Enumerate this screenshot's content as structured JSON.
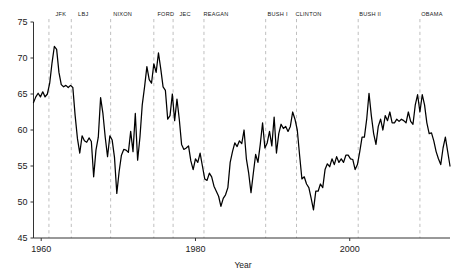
{
  "chart_data": {
    "type": "line",
    "title": "",
    "xlabel": "Year",
    "ylabel": "",
    "xlim": [
      1959,
      2013
    ],
    "ylim": [
      45,
      75
    ],
    "grid": false,
    "legend": "none",
    "x_ticks": [
      1960,
      1980,
      2000
    ],
    "x_tick_labels": [
      "1960",
      "1980",
      "2000"
    ],
    "y_ticks": [
      45,
      50,
      55,
      60,
      65,
      70,
      75
    ],
    "y_tick_labels": [
      "45",
      "50",
      "55",
      "60",
      "65",
      "70",
      "75"
    ],
    "annotations": [
      {
        "label": "JFK",
        "year": 1961.0
      },
      {
        "label": "LBJ",
        "year": 1963.9
      },
      {
        "label": "NIXON",
        "year": 1969.0
      },
      {
        "label": "FORD",
        "year": 1974.6
      },
      {
        "label": "JEC",
        "year": 1977.1
      },
      {
        "label": "REAGAN",
        "year": 1981.1
      },
      {
        "label": "BUSH I",
        "year": 1989.1
      },
      {
        "label": "CLINTON",
        "year": 1993.1
      },
      {
        "label": "BUSH II",
        "year": 2001.1
      },
      {
        "label": "OBAMA",
        "year": 2009.1
      }
    ],
    "series": [
      {
        "name": "value",
        "color": "#000000",
        "x": [
          1959.0,
          1959.3,
          1959.6,
          1959.9,
          1960.2,
          1960.5,
          1960.8,
          1961.1,
          1961.4,
          1961.7,
          1962.0,
          1962.3,
          1962.6,
          1962.9,
          1963.2,
          1963.5,
          1963.8,
          1964.1,
          1964.4,
          1964.7,
          1965.0,
          1965.3,
          1965.6,
          1965.9,
          1966.2,
          1966.5,
          1966.8,
          1967.1,
          1967.4,
          1967.7,
          1968.0,
          1968.3,
          1968.6,
          1968.9,
          1969.2,
          1969.5,
          1969.8,
          1970.1,
          1970.4,
          1970.7,
          1971.0,
          1971.3,
          1971.6,
          1971.9,
          1972.2,
          1972.5,
          1972.8,
          1973.1,
          1973.4,
          1973.7,
          1974.0,
          1974.3,
          1974.6,
          1974.9,
          1975.2,
          1975.5,
          1975.8,
          1976.1,
          1976.4,
          1976.7,
          1977.0,
          1977.3,
          1977.6,
          1977.9,
          1978.2,
          1978.5,
          1978.8,
          1979.1,
          1979.4,
          1979.7,
          1980.0,
          1980.3,
          1980.6,
          1980.9,
          1981.2,
          1981.5,
          1981.8,
          1982.1,
          1982.4,
          1982.7,
          1983.0,
          1983.3,
          1983.6,
          1983.9,
          1984.2,
          1984.5,
          1984.8,
          1985.1,
          1985.4,
          1985.7,
          1986.0,
          1986.3,
          1986.6,
          1986.9,
          1987.2,
          1987.5,
          1987.8,
          1988.1,
          1988.4,
          1988.7,
          1989.0,
          1989.3,
          1989.6,
          1989.9,
          1990.2,
          1990.5,
          1990.8,
          1991.1,
          1991.4,
          1991.7,
          1992.0,
          1992.3,
          1992.6,
          1992.9,
          1993.2,
          1993.5,
          1993.8,
          1994.1,
          1994.4,
          1994.7,
          1995.0,
          1995.3,
          1995.6,
          1995.9,
          1996.2,
          1996.5,
          1996.8,
          1997.1,
          1997.4,
          1997.7,
          1998.0,
          1998.3,
          1998.6,
          1998.9,
          1999.2,
          1999.5,
          1999.8,
          2000.1,
          2000.4,
          2000.7,
          2001.0,
          2001.3,
          2001.6,
          2001.9,
          2002.2,
          2002.5,
          2002.8,
          2003.1,
          2003.4,
          2003.7,
          2004.0,
          2004.3,
          2004.6,
          2004.9,
          2005.2,
          2005.5,
          2005.8,
          2006.1,
          2006.4,
          2006.7,
          2007.0,
          2007.3,
          2007.6,
          2007.9,
          2008.2,
          2008.5,
          2008.8,
          2009.1,
          2009.4,
          2009.7,
          2010.0,
          2010.3,
          2010.6,
          2010.9,
          2011.2,
          2011.5,
          2011.8,
          2012.1,
          2012.4,
          2012.7,
          2013.0
        ],
        "y": [
          63.8,
          64.6,
          65.1,
          64.6,
          65.3,
          64.6,
          65.0,
          66.5,
          69.3,
          71.6,
          71.2,
          68.0,
          66.3,
          66.0,
          66.2,
          65.9,
          66.2,
          65.9,
          62.0,
          58.8,
          56.8,
          59.2,
          58.5,
          58.3,
          58.9,
          58.4,
          53.5,
          57.2,
          59.0,
          64.5,
          62.3,
          59.0,
          56.3,
          59.2,
          58.6,
          56.2,
          51.2,
          54.2,
          56.5,
          57.3,
          57.2,
          56.9,
          59.8,
          57.0,
          62.3,
          55.8,
          59.0,
          63.5,
          66.0,
          68.8,
          67.0,
          66.5,
          69.2,
          68.0,
          70.7,
          68.5,
          66.0,
          65.5,
          61.5,
          62.0,
          65.0,
          61.3,
          64.3,
          61.5,
          58.0,
          57.3,
          57.5,
          57.8,
          55.7,
          54.5,
          56.0,
          55.5,
          56.8,
          55.0,
          53.2,
          53.0,
          54.0,
          53.5,
          52.2,
          51.5,
          50.8,
          49.4,
          50.5,
          51.0,
          52.0,
          55.5,
          57.0,
          58.2,
          57.7,
          58.5,
          58.1,
          60.0,
          56.0,
          54.0,
          51.3,
          54.0,
          56.6,
          55.5,
          58.0,
          61.0,
          57.5,
          58.2,
          59.8,
          57.8,
          61.8,
          56.8,
          59.5,
          60.8,
          60.2,
          60.5,
          59.8,
          60.5,
          62.5,
          61.5,
          60.0,
          56.5,
          53.2,
          53.5,
          52.5,
          52.0,
          50.5,
          48.9,
          51.5,
          51.5,
          52.5,
          52.0,
          54.5,
          55.3,
          54.9,
          56.0,
          55.2,
          56.3,
          55.5,
          56.0,
          55.5,
          56.5,
          56.5,
          56.0,
          55.9,
          54.5,
          55.2,
          57.0,
          59.0,
          59.0,
          61.5,
          65.1,
          62.0,
          59.5,
          58.0,
          60.5,
          61.5,
          60.0,
          62.0,
          61.3,
          62.5,
          61.0,
          61.0,
          61.5,
          61.2,
          61.5,
          61.3,
          61.0,
          62.5,
          61.2,
          60.8,
          63.5,
          64.9,
          62.5,
          64.9,
          63.5,
          61.0,
          59.5,
          59.6,
          58.5,
          57.0,
          56.0,
          55.2,
          57.5,
          59.0,
          57.0,
          55.0
        ]
      }
    ]
  }
}
